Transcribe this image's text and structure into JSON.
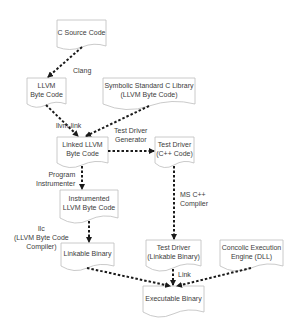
{
  "diagram": {
    "nodes": [
      {
        "id": "c_source",
        "label": "C Source Code"
      },
      {
        "id": "llvm_bc",
        "label": "LLVM\nByte Code"
      },
      {
        "id": "sym_lib",
        "label": "Symbolic Standard C Library\n(LLVM Byte Code)"
      },
      {
        "id": "linked_bc",
        "label": "Linked LLVM\nByte Code"
      },
      {
        "id": "test_driver_cpp",
        "label": "Test Driver\n(C++ Code)"
      },
      {
        "id": "instr_bc",
        "label": "Instrumented\nLLVM Byte Code"
      },
      {
        "id": "linkable_bin",
        "label": "Linkable Binary"
      },
      {
        "id": "test_driver_bin",
        "label": "Test Driver\n(Linkable Binary)"
      },
      {
        "id": "concolic",
        "label": "Concolic Execution\nEngine (DLL)"
      },
      {
        "id": "exe_bin",
        "label": "Executable Binary"
      }
    ],
    "edges": [
      {
        "from": "c_source",
        "to": "llvm_bc",
        "label": "Clang"
      },
      {
        "from": "llvm_bc",
        "to": "linked_bc",
        "label": "llvm-link"
      },
      {
        "from": "sym_lib",
        "to": "linked_bc",
        "label": ""
      },
      {
        "from": "linked_bc",
        "to": "test_driver_cpp",
        "label": "Test Driver\nGenerator"
      },
      {
        "from": "linked_bc",
        "to": "instr_bc",
        "label": "Program\nInstrumenter"
      },
      {
        "from": "instr_bc",
        "to": "linkable_bin",
        "label": "llc\n(LLVM Byte Code\nCompiler)"
      },
      {
        "from": "test_driver_cpp",
        "to": "test_driver_bin",
        "label": "MS C++\nCompiler"
      },
      {
        "from": "linkable_bin",
        "to": "exe_bin",
        "label": ""
      },
      {
        "from": "test_driver_bin",
        "to": "exe_bin",
        "label": "Link"
      },
      {
        "from": "concolic",
        "to": "exe_bin",
        "label": ""
      }
    ],
    "text": {
      "c_source_1": "C Source Code",
      "llvm_bc_1": "LLVM",
      "llvm_bc_2": "Byte Code",
      "sym_lib_1": "Symbolic Standard C Library",
      "sym_lib_2": "(LLVM Byte Code)",
      "linked_bc_1": "Linked LLVM",
      "linked_bc_2": "Byte Code",
      "test_driver_cpp_1": "Test Driver",
      "test_driver_cpp_2": "(C++ Code)",
      "instr_bc_1": "Instrumented",
      "instr_bc_2": "LLVM Byte Code",
      "linkable_bin_1": "Linkable Binary",
      "test_driver_bin_1": "Test Driver",
      "test_driver_bin_2": "(Linkable Binary)",
      "concolic_1": "Concolic Execution",
      "concolic_2": "Engine (DLL)",
      "exe_bin_1": "Executable Binary",
      "edge_clang": "Clang",
      "edge_llvm_link": "llvm-link",
      "edge_tdg_1": "Test Driver",
      "edge_tdg_2": "Generator",
      "edge_pi_1": "Program",
      "edge_pi_2": "Instrumenter",
      "edge_llc_1": "llc",
      "edge_llc_2": "(LLVM Byte Code",
      "edge_llc_3": "Compiler)",
      "edge_msc_1": "MS C++",
      "edge_msc_2": "Compiler",
      "edge_link": "Link"
    },
    "colors": {
      "box_stroke": "#bdbdbd",
      "arrow": "#1a1a1a",
      "text": "#3c3c3c",
      "background": "#ffffff"
    }
  }
}
